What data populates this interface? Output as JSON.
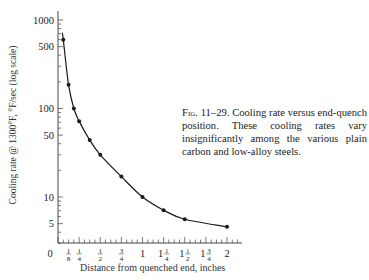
{
  "chart_data": {
    "type": "line",
    "title": "",
    "xlabel": "Distance from quenched end, inches",
    "ylabel": "Cooling rate @ 1300°F, °F/sec (log scale)",
    "yscale": "log",
    "xlim": [
      0,
      2
    ],
    "ylim": [
      3,
      1000
    ],
    "x_tick_labels": [
      {
        "value": 0,
        "label": "0"
      },
      {
        "value": 0.125,
        "label": "1/8"
      },
      {
        "value": 0.25,
        "label": "1/4"
      },
      {
        "value": 0.5,
        "label": "1/2"
      },
      {
        "value": 0.75,
        "label": "3/4"
      },
      {
        "value": 1,
        "label": "1"
      },
      {
        "value": 1.25,
        "label": "1 1/4"
      },
      {
        "value": 1.5,
        "label": "1 1/2"
      },
      {
        "value": 1.75,
        "label": "1 3/4"
      },
      {
        "value": 2,
        "label": "2"
      }
    ],
    "x_minor_tick_step": 0.0625,
    "y_tick_labels": [
      1000,
      500,
      100,
      50,
      10,
      5
    ],
    "grid": false,
    "legend": null,
    "series": [
      {
        "name": "Cooling rate",
        "x": [
          0.0625,
          0.125,
          0.1875,
          0.25,
          0.375,
          0.5,
          0.75,
          1.0,
          1.25,
          1.5,
          2.0
        ],
        "y": [
          600,
          185,
          100,
          72,
          44,
          30,
          17,
          10,
          7.1,
          5.6,
          4.6
        ],
        "markers": true
      }
    ],
    "caption": {
      "figure": "Fig. 11–29.",
      "text": "Cooling rate versus end-quench position. These cooling rates vary insignificantly among the various plain carbon and low-alloy steels."
    }
  },
  "labels": {
    "xlabel": "Distance from quenched end, inches",
    "ylabel": "Cooling rate @ 1300°F, °F/sec (log scale)",
    "caption_fig": "Fig. 11–29.",
    "caption_text": "Cooling rate versus end-quench position. These cooling rates vary insignificantly among the various plain carbon and low-alloy steels."
  }
}
